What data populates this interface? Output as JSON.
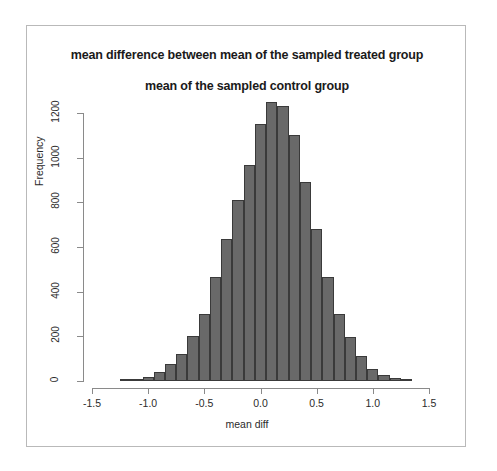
{
  "figure": {
    "title_line1": "mean difference between mean of the sampled treated group",
    "title_line2": "mean of the sampled control group",
    "bar_fill": "#696969",
    "bar_border": "#3a3a3a",
    "axis_color": "#8a8a8a",
    "frame_color": "#b9b9b9",
    "background": "#ffffff"
  },
  "chart_data": {
    "type": "bar",
    "title": "mean difference between mean of the sampled treated group\nmean of the sampled control group",
    "xlabel": "mean diff",
    "ylabel": "Frequency",
    "xlim": [
      -1.5,
      1.5
    ],
    "ylim": [
      0,
      1250
    ],
    "grid": false,
    "legend": null,
    "bin_width": 0.1,
    "xticks": [
      -1.5,
      -1.0,
      -0.5,
      0.0,
      0.5,
      1.0,
      1.5
    ],
    "xtick_labels": [
      "-1.5",
      "-1.0",
      "-0.5",
      "0.0",
      "0.5",
      "1.0",
      "1.5"
    ],
    "yticks": [
      0,
      200,
      400,
      600,
      800,
      1000,
      1200
    ],
    "ytick_labels": [
      "0",
      "200",
      "400",
      "600",
      "800",
      "1000",
      "1200"
    ],
    "bin_edges": [
      -1.25,
      -1.15,
      -1.05,
      -0.95,
      -0.85,
      -0.75,
      -0.65,
      -0.55,
      -0.45,
      -0.35,
      -0.25,
      -0.15,
      -0.05,
      0.05,
      0.15,
      0.25,
      0.35,
      0.45,
      0.55,
      0.65,
      0.75,
      0.85,
      0.95,
      1.05,
      1.15,
      1.25,
      1.35
    ],
    "bin_centers": [
      -1.2,
      -1.1,
      -1.0,
      -0.9,
      -0.8,
      -0.7,
      -0.6,
      -0.5,
      -0.4,
      -0.3,
      -0.2,
      -0.1,
      0.0,
      0.1,
      0.2,
      0.3,
      0.4,
      0.5,
      0.6,
      0.7,
      0.8,
      0.9,
      1.0,
      1.1,
      1.2,
      1.3
    ],
    "categories": [
      "-1.20",
      "-1.10",
      "-1.00",
      "-0.90",
      "-0.80",
      "-0.70",
      "-0.60",
      "-0.50",
      "-0.40",
      "-0.30",
      "-0.20",
      "-0.10",
      "0.00",
      "0.10",
      "0.20",
      "0.30",
      "0.40",
      "0.50",
      "0.60",
      "0.70",
      "0.80",
      "0.90",
      "1.00",
      "1.10",
      "1.20",
      "1.30"
    ],
    "values": [
      8,
      8,
      20,
      40,
      75,
      120,
      200,
      300,
      465,
      635,
      810,
      965,
      1150,
      1250,
      1230,
      1100,
      890,
      680,
      465,
      300,
      195,
      110,
      55,
      28,
      15,
      10
    ]
  }
}
